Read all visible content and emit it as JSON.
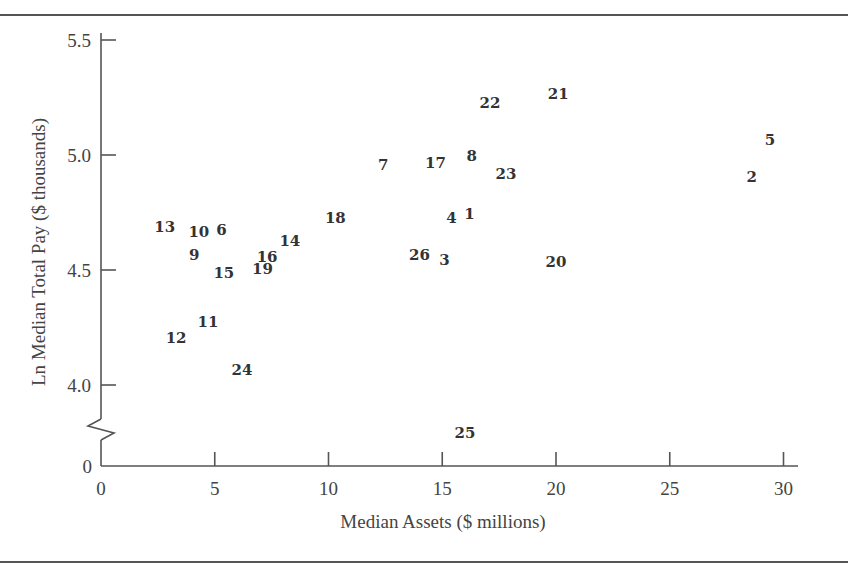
{
  "chart_data": {
    "type": "scatter",
    "title": "",
    "xlabel": "Median Assets ($ millions)",
    "ylabel": "Ln Median Total Pay ($ thousands)",
    "xlim": [
      0,
      30.5
    ],
    "ylim": [
      4.0,
      5.5
    ],
    "y_axis_break": true,
    "y_break_baseline_label": "0",
    "x_ticks": [
      "0",
      "5",
      "10",
      "15",
      "20",
      "25",
      "30"
    ],
    "y_ticks": [
      "4.0",
      "4.5",
      "5.0",
      "5.5"
    ],
    "grid": false,
    "legend": null,
    "points": [
      {
        "label": "1",
        "x": 16.2,
        "y": 4.75
      },
      {
        "label": "2",
        "x": 28.6,
        "y": 4.91
      },
      {
        "label": "3",
        "x": 15.1,
        "y": 4.55
      },
      {
        "label": "4",
        "x": 15.4,
        "y": 4.73
      },
      {
        "label": "5",
        "x": 29.4,
        "y": 5.07
      },
      {
        "label": "6",
        "x": 5.3,
        "y": 4.68
      },
      {
        "label": "7",
        "x": 12.4,
        "y": 4.96
      },
      {
        "label": "8",
        "x": 16.3,
        "y": 5.0
      },
      {
        "label": "9",
        "x": 4.1,
        "y": 4.57
      },
      {
        "label": "10",
        "x": 4.3,
        "y": 4.67
      },
      {
        "label": "11",
        "x": 4.7,
        "y": 4.28
      },
      {
        "label": "12",
        "x": 3.3,
        "y": 4.21
      },
      {
        "label": "13",
        "x": 2.8,
        "y": 4.69
      },
      {
        "label": "14",
        "x": 8.3,
        "y": 4.63
      },
      {
        "label": "15",
        "x": 5.4,
        "y": 4.49
      },
      {
        "label": "16",
        "x": 7.3,
        "y": 4.56
      },
      {
        "label": "17",
        "x": 14.7,
        "y": 4.97
      },
      {
        "label": "18",
        "x": 10.3,
        "y": 4.73
      },
      {
        "label": "19",
        "x": 7.1,
        "y": 4.51
      },
      {
        "label": "20",
        "x": 20.0,
        "y": 4.54
      },
      {
        "label": "21",
        "x": 20.1,
        "y": 5.27
      },
      {
        "label": "22",
        "x": 17.1,
        "y": 5.23
      },
      {
        "label": "23",
        "x": 17.8,
        "y": 4.92
      },
      {
        "label": "24",
        "x": 6.2,
        "y": 4.07
      },
      {
        "label": "25",
        "x": 16.0,
        "y": null,
        "note": "below axis break"
      },
      {
        "label": "26",
        "x": 14.0,
        "y": 4.57
      }
    ]
  },
  "axes": {
    "xlabel": "Median Assets ($ millions)",
    "ylabel": "Ln Median Total Pay ($ thousands)",
    "x_ticks": [
      "0",
      "5",
      "10",
      "15",
      "20",
      "25",
      "30"
    ],
    "y_ticks": [
      "4.0",
      "4.5",
      "5.0",
      "5.5"
    ],
    "y_zero": "0"
  }
}
